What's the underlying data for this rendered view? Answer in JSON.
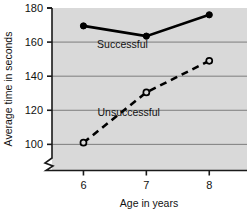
{
  "chart_data": {
    "type": "line",
    "title": "",
    "subtitle": "",
    "xlabel": "Age in years",
    "ylabel": "Average time in seconds",
    "x": [
      6,
      7,
      8
    ],
    "xtick_labels": [
      "6",
      "7",
      "8"
    ],
    "ytick_labels": [
      "100",
      "120",
      "140",
      "160",
      "180"
    ],
    "yticks": [
      100,
      120,
      140,
      160,
      180
    ],
    "xlim": [
      5.5,
      8.6
    ],
    "ylim": [
      92,
      180
    ],
    "axis_break": true,
    "axis_break_axis": "y",
    "grid": true,
    "grid_axis": "y",
    "legend": "inline-annotations",
    "plot_background": "#d9d9d9",
    "page_background": "#ffffff",
    "series": [
      {
        "name": "Successful",
        "label": "Successful",
        "values": [
          169.5,
          163.5,
          176
        ],
        "line_style": "solid",
        "marker": "filled-circle",
        "color": "#000000"
      },
      {
        "name": "Unsuccessful",
        "label": "Unsuccessful",
        "values": [
          101,
          130.5,
          149
        ],
        "line_style": "dashed",
        "marker": "open-circle",
        "color": "#000000"
      }
    ],
    "annotations": [
      {
        "text": "Successful",
        "x": 6.62,
        "y": 156.5
      },
      {
        "text": "Unsuccessful",
        "x": 6.72,
        "y": 116.5
      }
    ]
  }
}
